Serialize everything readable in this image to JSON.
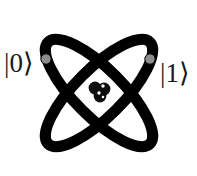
{
  "figure": {
    "name": "atom-qubit-diagram",
    "background_color": "#ffffff",
    "width": 197,
    "height": 176
  },
  "labels": {
    "left_state": "|0⟩",
    "right_state": "|1⟩",
    "text_color": "#1a1a1a"
  },
  "orbits": {
    "stroke_color": "#000000",
    "stroke_width": 11,
    "center_x": 99,
    "center_y": 93,
    "radius_x": 24,
    "radius_y": 72,
    "rotation_a_deg": 45,
    "rotation_b_deg": -45
  },
  "electrons": [
    {
      "name": "electron-left",
      "cx": 46,
      "cy": 59,
      "r": 5.2,
      "fill": "#8c8c8c",
      "stroke": "#000000"
    },
    {
      "name": "electron-right",
      "cx": 150,
      "cy": 59,
      "r": 5.2,
      "fill": "#8c8c8c",
      "stroke": "#000000"
    }
  ],
  "nucleus": {
    "fill": "#0d0d0d",
    "highlight": "#ffffff",
    "particles": [
      {
        "cx": 95,
        "cy": 88,
        "r": 6.4
      },
      {
        "cx": 104,
        "cy": 89,
        "r": 6.4
      },
      {
        "cx": 100,
        "cy": 96,
        "r": 6.4
      }
    ],
    "highlights": [
      {
        "cx": 103,
        "cy": 86,
        "r": 1.7
      },
      {
        "cx": 99,
        "cy": 93,
        "r": 1.7
      },
      {
        "cx": 103,
        "cy": 97,
        "r": 1.3
      }
    ]
  }
}
